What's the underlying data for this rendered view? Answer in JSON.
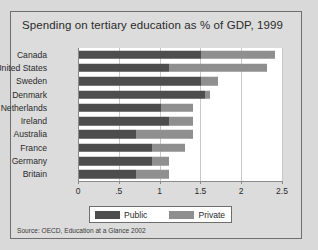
{
  "card": {
    "title": "Spending on tertiary education as % of GDP, 1999",
    "source": "Source:  OECD, Education at a Glance 2002"
  },
  "legend": {
    "public_label": "Public",
    "private_label": "Private"
  },
  "colors": {
    "public": "#4d4d4d",
    "private": "#8f8f8f",
    "card_background": "#dcdcdc",
    "plot_background": "#ffffff",
    "grid": "#c9c9c9",
    "axis": "#8a8a8a"
  },
  "chart_data": {
    "type": "bar",
    "orientation": "horizontal",
    "stacked": true,
    "title": "Spending on tertiary education as % of GDP, 1999",
    "xlabel": "",
    "ylabel": "",
    "xlim": [
      0,
      2.5
    ],
    "xticks": [
      0,
      0.5,
      1,
      1.5,
      2,
      2.5
    ],
    "xtick_labels": [
      "0",
      ".5",
      "1",
      "1.5",
      "2",
      "2.5"
    ],
    "grid": true,
    "legend_position": "bottom",
    "categories": [
      "Canada",
      "United States",
      "Sweden",
      "Denmark",
      "Netherlands",
      "Ireland",
      "Australia",
      "France",
      "Germany",
      "Britain"
    ],
    "series": [
      {
        "name": "Public",
        "color": "#4d4d4d",
        "values": [
          1.5,
          1.1,
          1.5,
          1.55,
          1.0,
          1.1,
          0.7,
          0.9,
          0.9,
          0.7
        ]
      },
      {
        "name": "Private",
        "color": "#8f8f8f",
        "values": [
          0.9,
          1.2,
          0.2,
          0.05,
          0.4,
          0.3,
          0.7,
          0.4,
          0.2,
          0.4
        ]
      }
    ],
    "totals": [
      2.4,
      2.3,
      1.7,
      1.6,
      1.4,
      1.4,
      1.4,
      1.3,
      1.1,
      1.1
    ]
  }
}
